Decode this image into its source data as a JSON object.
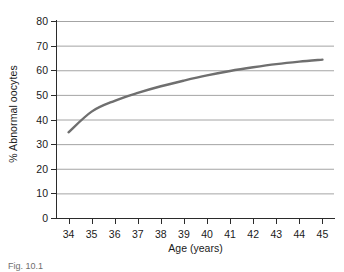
{
  "chart_data": {
    "type": "line",
    "title": "",
    "xlabel": "Age (years)",
    "ylabel": "% Abnormal oocytes",
    "xlim": [
      33.5,
      45.5
    ],
    "ylim": [
      0,
      80
    ],
    "grid": "horizontal",
    "legend": "none",
    "x_ticks": [
      "34",
      "35",
      "36",
      "37",
      "38",
      "39",
      "40",
      "41",
      "42",
      "43",
      "44",
      "45"
    ],
    "y_ticks": [
      "0",
      "10",
      "20",
      "30",
      "40",
      "50",
      "60",
      "70",
      "80"
    ],
    "series": [
      {
        "name": "% Abnormal oocytes",
        "color": "#6f6f6f",
        "x": [
          34,
          35,
          36,
          37,
          38,
          39,
          40,
          41,
          42,
          43,
          44,
          45
        ],
        "values": [
          34.8,
          43.2,
          47.6,
          50.8,
          53.5,
          55.8,
          57.9,
          59.7,
          61.2,
          62.5,
          63.5,
          64.3
        ]
      }
    ]
  },
  "axes": {
    "y_title": "% Abnormal oocytes",
    "x_title": "Age (years)"
  },
  "caption": {
    "text": "Fig. 10.1"
  },
  "style": {
    "curve_color": "#6f6f6f",
    "grid_color": "#9a9a9a",
    "axis_color": "#2b2b2b",
    "background": "#ffffff"
  }
}
